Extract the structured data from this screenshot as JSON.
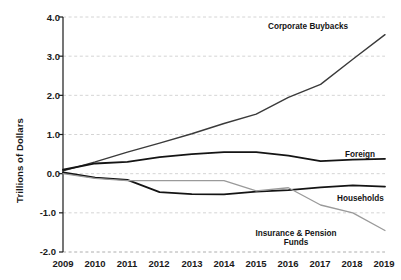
{
  "chart_data": {
    "type": "line",
    "title": "",
    "xlabel": "",
    "ylabel": "Trillions of Dollars",
    "x": [
      2009,
      2010,
      2011,
      2012,
      2013,
      2014,
      2015,
      2016,
      2017,
      2018,
      2019
    ],
    "xticklabels": [
      "2009",
      "2010",
      "2011",
      "2012",
      "2013",
      "2014",
      "2015",
      "2016",
      "2017",
      "2018",
      "2019"
    ],
    "yticklabels": [
      "4.0",
      "3.0",
      "2.0",
      "1.0",
      "0.0",
      "-1.0",
      "-2.0"
    ],
    "yticks": [
      4.0,
      3.0,
      2.0,
      1.0,
      0.0,
      -1.0,
      -2.0
    ],
    "ylim": [
      -2.0,
      4.0
    ],
    "xlim": [
      2009,
      2019
    ],
    "grid": "horizontal-dashed",
    "legend": "inline-labels",
    "series": [
      {
        "name": "Corporate Buybacks",
        "color": "#3a3a3a",
        "width": 1.4,
        "values": [
          0.07,
          0.3,
          0.55,
          0.78,
          1.02,
          1.28,
          1.52,
          1.95,
          2.28,
          2.92,
          3.55
        ]
      },
      {
        "name": "Foreign",
        "color": "#141414",
        "width": 1.8,
        "values": [
          0.1,
          0.26,
          0.3,
          0.42,
          0.5,
          0.55,
          0.55,
          0.46,
          0.32,
          0.36,
          0.38
        ]
      },
      {
        "name": "Households",
        "color": "#141414",
        "width": 1.8,
        "values": [
          0.03,
          -0.1,
          -0.16,
          -0.47,
          -0.52,
          -0.53,
          -0.46,
          -0.42,
          -0.35,
          -0.3,
          -0.33
        ]
      },
      {
        "name": "Insurance & Pension Funds",
        "color": "#9a9a9a",
        "width": 1.3,
        "values": [
          0.0,
          -0.12,
          -0.18,
          -0.18,
          -0.18,
          -0.18,
          -0.44,
          -0.36,
          -0.8,
          -1.0,
          -1.45
        ]
      }
    ],
    "annotations": [
      {
        "text": "Corporate Buybacks",
        "series": "Corporate Buybacks"
      },
      {
        "text": "Foreign",
        "series": "Foreign"
      },
      {
        "text": "Households",
        "series": "Households"
      },
      {
        "text": "Insurance & Pension",
        "series": "Insurance & Pension Funds"
      },
      {
        "text": "Funds",
        "series": "Insurance & Pension Funds"
      }
    ]
  },
  "labels": {
    "corporate_buybacks": "Corporate Buybacks",
    "foreign": "Foreign",
    "households": "Households",
    "insurance_line1": "Insurance & Pension",
    "insurance_line2": "Funds"
  }
}
